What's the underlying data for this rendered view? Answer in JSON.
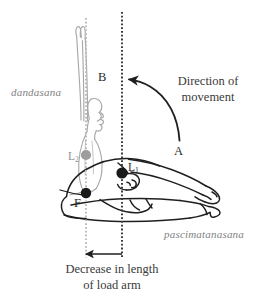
{
  "figure": {
    "background_color": "#ffffff",
    "width": 264,
    "height": 298,
    "colors": {
      "dark_ink": "#2b2b2b",
      "gray_ink": "#9a9a9a",
      "text": "#3a3a3a",
      "pose_label": "#828282",
      "dotted_dark": "#3a3a3a",
      "dotted_gray": "#b4b4b4"
    }
  },
  "pose_labels": {
    "upright": "dandasana",
    "forward_bend": "pascimatanasana"
  },
  "point_labels": {
    "fulcrum": "F",
    "load_near": "L",
    "load_near_sub": "1",
    "load_far": "L",
    "load_far_sub": "2",
    "start_position": "A",
    "end_position": "B"
  },
  "annotations": {
    "direction_line1": "Direction of",
    "direction_line2": "movement",
    "caption_line1": "Decrease in length",
    "caption_line2": "of load arm"
  },
  "markers": [
    {
      "name": "fulcrum-dot",
      "x": 86,
      "y": 193,
      "r": 5.2,
      "color": "#1e1e1e"
    },
    {
      "name": "load-near-dot",
      "x": 122,
      "y": 173,
      "r": 5.6,
      "color": "#1e1e1e"
    },
    {
      "name": "load-far-dot",
      "x": 86,
      "y": 155,
      "r": 5.2,
      "color": "#9d9d9d"
    }
  ],
  "reference_lines": [
    {
      "name": "gray-plumb-line",
      "x": 86,
      "y1": 18,
      "y2": 258,
      "color": "#b4b4b4"
    },
    {
      "name": "dark-plumb-line",
      "x": 122,
      "y1": 12,
      "y2": 258,
      "color": "#3a3a3a"
    }
  ],
  "arrows": {
    "curved_movement": {
      "from": "A",
      "to": "B",
      "direction": "right-to-left"
    },
    "load_arm": {
      "x_start": 122,
      "x_end": 84,
      "y": 254,
      "direction": "leftward"
    }
  }
}
